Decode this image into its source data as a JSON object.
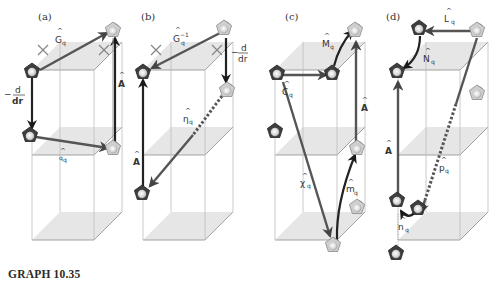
{
  "figure": {
    "caption": "GRAPH 10.35",
    "panels": [
      {
        "id": "a",
        "label": "(a)",
        "operators": [
          {
            "symbol": "G",
            "sub": "q",
            "hat": true,
            "name": "G-hat-q"
          },
          {
            "symbol": "−d/dr",
            "name": "minus-d-dr"
          },
          {
            "symbol": "A",
            "hat": true,
            "name": "A-hat"
          },
          {
            "symbol": "q",
            "sub": "q",
            "hat": true,
            "name": "q-hat-q"
          }
        ],
        "crosses": 2
      },
      {
        "id": "b",
        "label": "(b)",
        "operators": [
          {
            "symbol": "G",
            "sub": "q",
            "sup": "−1",
            "hat": true,
            "name": "G-hat-q-inverse"
          },
          {
            "symbol": "−d/dr",
            "name": "minus-d-dr"
          },
          {
            "symbol": "η",
            "sub": "q",
            "hat": true,
            "name": "eta-hat-q"
          },
          {
            "symbol": "A",
            "hat": true,
            "name": "A-hat"
          }
        ],
        "crosses": 2
      },
      {
        "id": "c",
        "label": "(c)",
        "operators": [
          {
            "symbol": "M",
            "sub": "q",
            "hat": true,
            "name": "M-hat-q"
          },
          {
            "symbol": "C",
            "sub": "q",
            "hat": true,
            "name": "C-hat-q"
          },
          {
            "symbol": "A",
            "hat": true,
            "name": "A-hat"
          },
          {
            "symbol": "χ",
            "sub": "q",
            "hat": true,
            "name": "chi-hat-q"
          },
          {
            "symbol": "m",
            "sub": "q",
            "hat": true,
            "name": "m-hat-q"
          }
        ]
      },
      {
        "id": "d",
        "label": "(d)",
        "operators": [
          {
            "symbol": "L",
            "sub": "q",
            "hat": true,
            "name": "L-hat-q"
          },
          {
            "symbol": "N",
            "sub": "q",
            "hat": true,
            "name": "N-hat-q"
          },
          {
            "symbol": "A",
            "hat": true,
            "name": "A-hat"
          },
          {
            "symbol": "p",
            "sub": "q",
            "hat": true,
            "name": "p-hat-q"
          },
          {
            "symbol": "n",
            "sub": "q",
            "hat": true,
            "name": "n-hat-q"
          }
        ]
      }
    ],
    "labels": {
      "a_label": "(a)",
      "b_label": "(b)",
      "c_label": "(c)",
      "d_label": "(d)",
      "hat": "^",
      "G": "G",
      "q": "q",
      "A": "A",
      "d": "d",
      "dr": "dr",
      "minus": "−",
      "inv": "−1",
      "eta": "η",
      "M": "M",
      "C": "C",
      "chi": "χ",
      "m": "m",
      "L": "L",
      "N": "N",
      "p": "p",
      "n": "n"
    },
    "colors": {
      "plane": "#e6e6e6",
      "arrow": "#555555",
      "arrow_dark": "#222222",
      "pentagon_dark": "#4a4a4a",
      "pentagon_light": "#d9d9d9",
      "box_edge": "#bdbdbd"
    }
  }
}
